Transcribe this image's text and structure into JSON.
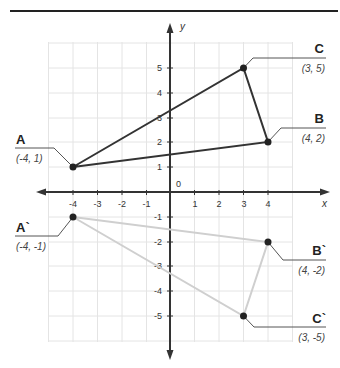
{
  "header_rule": true,
  "axes": {
    "x_label": "x",
    "y_label": "y",
    "origin_label": "0",
    "x_ticks": [
      "-4",
      "-3",
      "-2",
      "-1",
      "1",
      "2",
      "3",
      "4"
    ],
    "x_tick_values": [
      -4,
      -3,
      -2,
      -1,
      1,
      2,
      3,
      4
    ],
    "y_ticks": [
      "5",
      "4",
      "3",
      "2",
      "1",
      "-1",
      "-2",
      "-3",
      "-4",
      "-5"
    ],
    "y_tick_values": [
      5,
      4,
      3,
      2,
      1,
      -1,
      -2,
      -3,
      -4,
      -5
    ]
  },
  "triangles": [
    {
      "name": "original",
      "color": "#333333",
      "points": [
        {
          "label": "A",
          "coord_text": "(-4, 1)",
          "x": -4,
          "y": 1
        },
        {
          "label": "B",
          "coord_text": "(4, 2)",
          "x": 4,
          "y": 2
        },
        {
          "label": "C",
          "coord_text": "(3, 5)",
          "x": 3,
          "y": 5
        }
      ]
    },
    {
      "name": "reflection",
      "color": "#cccccc",
      "points": [
        {
          "label": "A`",
          "coord_text": "(-4, -1)",
          "x": -4,
          "y": -1
        },
        {
          "label": "B`",
          "coord_text": "(4, -2)",
          "x": 4,
          "y": -2
        },
        {
          "label": "C`",
          "coord_text": "(3, -5)",
          "x": 3,
          "y": -5
        }
      ]
    }
  ],
  "labels": {
    "A": "A",
    "A_coord": "(-4, 1)",
    "B": "B",
    "B_coord": "(4, 2)",
    "C": "C",
    "C_coord": "(3, 5)",
    "A2": "A`",
    "A2_coord": "(-4, -1)",
    "B2": "B`",
    "B2_coord": "(4, -2)",
    "C2": "C`",
    "C2_coord": "(3, -5)"
  }
}
